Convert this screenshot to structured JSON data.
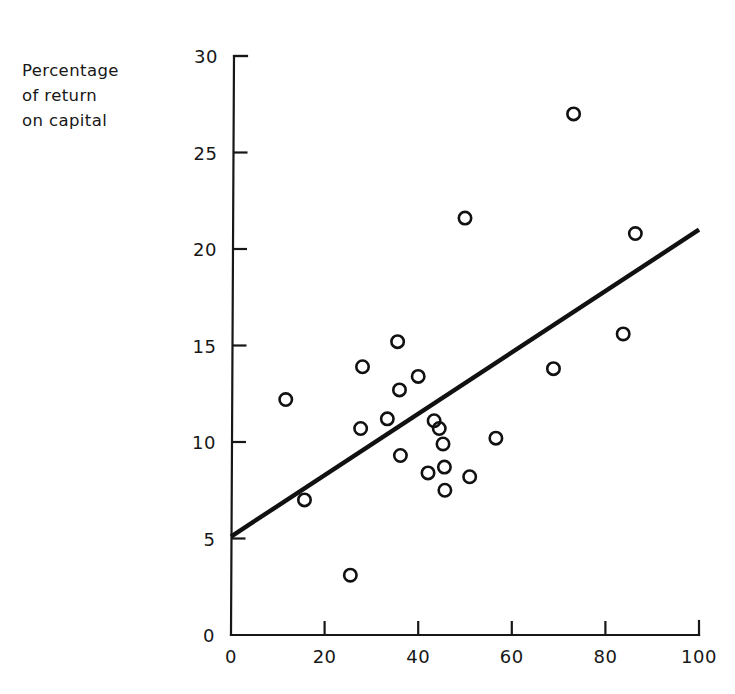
{
  "figure": {
    "background_color": "#ffffff",
    "ink_color": "#171717"
  },
  "axes": {
    "y_title_line1": "Percentage",
    "y_title_line2": "of return",
    "y_title_line3": "on capital",
    "y_title_full": "Percentage of return on capital",
    "x_title": "",
    "y_ticks": [
      "0",
      "5",
      "10",
      "15",
      "20",
      "25",
      "30"
    ],
    "x_ticks": [
      "0",
      "20",
      "40",
      "60",
      "80",
      "100"
    ]
  },
  "chart_data": {
    "type": "scatter",
    "title": "",
    "xlabel": "",
    "ylabel": "Percentage of return on capital",
    "xlim": [
      0,
      100
    ],
    "ylim": [
      0,
      30
    ],
    "xticks": [
      0,
      20,
      40,
      60,
      80,
      100
    ],
    "yticks": [
      0,
      5,
      10,
      15,
      20,
      25,
      30
    ],
    "grid": false,
    "legend": false,
    "marker": "open-circle",
    "points": [
      {
        "x": 11.7,
        "y": 12.2
      },
      {
        "x": 15.7,
        "y": 7.0
      },
      {
        "x": 25.5,
        "y": 3.1
      },
      {
        "x": 27.7,
        "y": 10.7
      },
      {
        "x": 28.1,
        "y": 13.9
      },
      {
        "x": 33.4,
        "y": 11.2
      },
      {
        "x": 35.6,
        "y": 15.2
      },
      {
        "x": 36.0,
        "y": 12.7
      },
      {
        "x": 36.2,
        "y": 9.3
      },
      {
        "x": 40.0,
        "y": 13.4
      },
      {
        "x": 43.4,
        "y": 11.1
      },
      {
        "x": 44.5,
        "y": 10.7
      },
      {
        "x": 45.3,
        "y": 9.9
      },
      {
        "x": 42.1,
        "y": 8.4
      },
      {
        "x": 45.6,
        "y": 8.7
      },
      {
        "x": 45.7,
        "y": 7.5
      },
      {
        "x": 50.0,
        "y": 21.6
      },
      {
        "x": 51.0,
        "y": 8.2
      },
      {
        "x": 56.6,
        "y": 10.2
      },
      {
        "x": 68.9,
        "y": 13.8
      },
      {
        "x": 73.2,
        "y": 27.0
      },
      {
        "x": 83.8,
        "y": 15.6
      },
      {
        "x": 86.4,
        "y": 20.8
      }
    ],
    "trend_line": {
      "type": "linear-fit",
      "x_start": 0,
      "y_start": 5.1,
      "x_end": 100,
      "y_end": 21.0
    }
  }
}
